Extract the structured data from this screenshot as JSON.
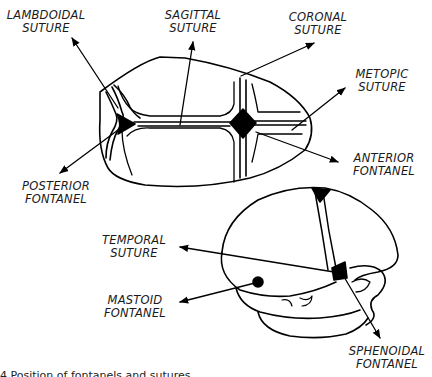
{
  "diagram": {
    "type": "anatomical line drawing",
    "views": [
      "superior (top) view",
      "lateral (side) view"
    ],
    "line_color": "#000000",
    "background": "#ffffff"
  },
  "labels": {
    "lambdoidal": [
      "LAMBDOIDAL",
      "SUTURE"
    ],
    "sagittal": [
      "SAGITTAL",
      "SUTURE"
    ],
    "coronal": [
      "CORONAL",
      "SUTURE"
    ],
    "metopic": [
      "METOPIC",
      "SUTURE"
    ],
    "anterior_fontanel": [
      "ANTERIOR",
      "FONTANEL"
    ],
    "posterior_fontanel": [
      "POSTERIOR",
      "FONTANEL"
    ],
    "temporal": [
      "TEMPORAL",
      "SUTURE"
    ],
    "mastoid_fontanel": [
      "MASTOID",
      "FONTANEL"
    ],
    "sphenoidal_fontanel": [
      "SPHENOIDAL",
      "FONTANEL"
    ]
  },
  "caption": {
    "text": "4 Position of fontanels and sutures",
    "clipped": true
  }
}
